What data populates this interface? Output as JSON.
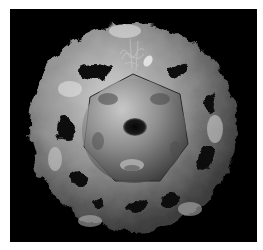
{
  "image": {
    "subject": "grayscale 3D surface rendering of a nested spherical capsid structure",
    "description": "Lumpy outer shell with irregular openings surrounding a smooth inner icosahedral core with a central pentagonal pore; thin filament strands on top",
    "colors": {
      "background": "#000000",
      "border": "#ffffff",
      "shell_light": "#d8d8d8",
      "shell_mid": "#8a8a8a",
      "shell_dark": "#3a3a3a",
      "core_light": "#c4c4c4",
      "core_dark": "#4a4a4a"
    }
  }
}
